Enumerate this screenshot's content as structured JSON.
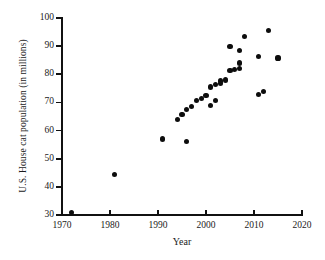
{
  "chart_data": {
    "type": "scatter",
    "title": "",
    "xlabel": "Year",
    "ylabel": "U.S. House cat population (in millions)",
    "xlim": [
      1970,
      2020
    ],
    "ylim": [
      30,
      100
    ],
    "xticks": [
      1970,
      1980,
      1990,
      2000,
      2010,
      2020
    ],
    "yticks": [
      30,
      40,
      50,
      60,
      70,
      80,
      90,
      100
    ],
    "grid": false,
    "legend": null,
    "marker": {
      "shape": "circle",
      "color": "#0d0d0d",
      "size": 5
    },
    "series": [
      {
        "name": "U.S. house cat population",
        "points": [
          {
            "x": 1972,
            "y": 31.0
          },
          {
            "x": 1981,
            "y": 44.5
          },
          {
            "x": 1991,
            "y": 57.0
          },
          {
            "x": 1994,
            "y": 64.0
          },
          {
            "x": 1995,
            "y": 65.8
          },
          {
            "x": 1996,
            "y": 56.1
          },
          {
            "x": 1996,
            "y": 67.6
          },
          {
            "x": 1997,
            "y": 68.5
          },
          {
            "x": 1998,
            "y": 70.8
          },
          {
            "x": 1999,
            "y": 71.5
          },
          {
            "x": 2000,
            "y": 72.6
          },
          {
            "x": 2001,
            "y": 69.0
          },
          {
            "x": 2001,
            "y": 75.5
          },
          {
            "x": 2002,
            "y": 76.3
          },
          {
            "x": 2002,
            "y": 70.7
          },
          {
            "x": 2003,
            "y": 76.8
          },
          {
            "x": 2003,
            "y": 77.6
          },
          {
            "x": 2004,
            "y": 78.0
          },
          {
            "x": 2005,
            "y": 81.3
          },
          {
            "x": 2005,
            "y": 89.8
          },
          {
            "x": 2006,
            "y": 81.7
          },
          {
            "x": 2007,
            "y": 82.2
          },
          {
            "x": 2007,
            "y": 88.4
          },
          {
            "x": 2007,
            "y": 84.0
          },
          {
            "x": 2008,
            "y": 93.3
          },
          {
            "x": 2011,
            "y": 72.9
          },
          {
            "x": 2011,
            "y": 86.4
          },
          {
            "x": 2012,
            "y": 74.0
          },
          {
            "x": 2013,
            "y": 95.6
          },
          {
            "x": 2015,
            "y": 85.8
          }
        ]
      }
    ]
  },
  "axes": {
    "y_title": "U.S. House cat population (in millions)",
    "x_title": "Year",
    "y_tick_labels": [
      "30",
      "40",
      "50",
      "60",
      "70",
      "80",
      "90",
      "100"
    ],
    "x_tick_labels": [
      "1970",
      "1980",
      "1990",
      "2000",
      "2010",
      "2020"
    ]
  }
}
